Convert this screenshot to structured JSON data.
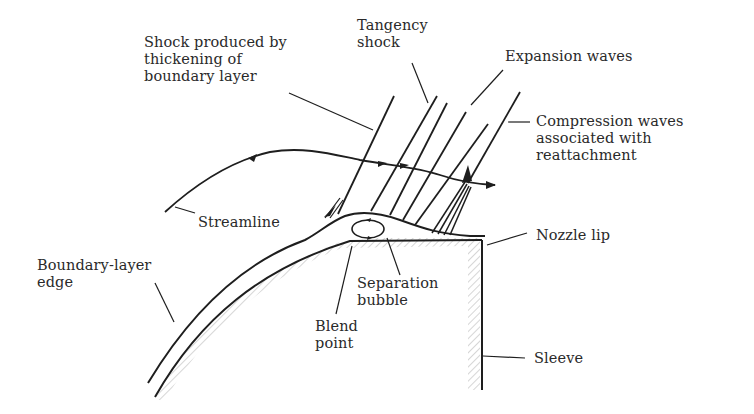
{
  "diagram": {
    "type": "schematic",
    "colors": {
      "line": "#1e1e1e",
      "text": "#2a2a2a",
      "hatch": "#bdbdbd",
      "background": "#ffffff"
    },
    "labels": {
      "shock_thickening": [
        "Shock produced by",
        "thickening of",
        "boundary layer"
      ],
      "tangency_shock": [
        "Tangency",
        "shock"
      ],
      "expansion_waves": [
        "Expansion waves"
      ],
      "compression_waves": [
        "Compression waves",
        "associated with",
        "reattachment"
      ],
      "streamline": [
        "Streamline"
      ],
      "nozzle_lip": [
        "Nozzle lip"
      ],
      "boundary_layer_edge": [
        "Boundary-layer",
        "edge"
      ],
      "separation_bubble": [
        "Separation",
        "bubble"
      ],
      "blend_point": [
        "Blend",
        "point"
      ],
      "sleeve": [
        "Sleeve"
      ]
    }
  }
}
